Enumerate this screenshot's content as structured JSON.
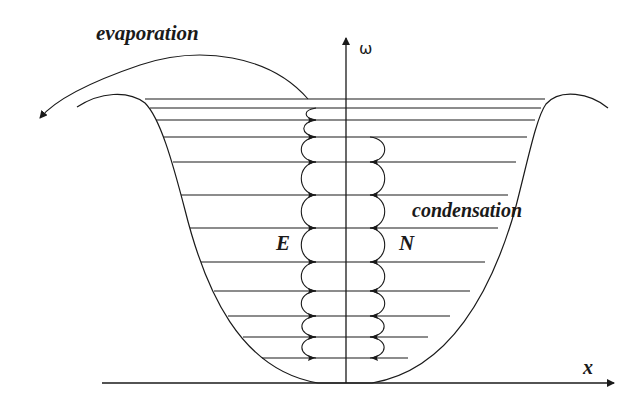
{
  "labels": {
    "evaporation": "evaporation",
    "condensation": "condensation",
    "E": "E",
    "N": "N",
    "omega_axis": "ω",
    "x_axis": "x"
  },
  "levels_count": 12,
  "colors": {
    "ink": "#1a1a1a",
    "background": "#ffffff"
  }
}
